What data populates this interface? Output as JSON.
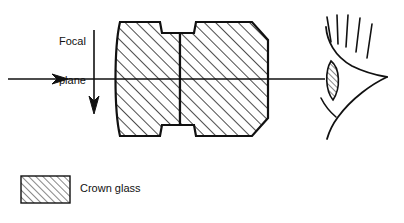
{
  "figure": {
    "type": "optical-ray-diagram",
    "background_color": "#ffffff",
    "ink_color": "#111111",
    "width": 404,
    "height": 223
  },
  "labels": {
    "focal_plane_line1": "Focal",
    "focal_plane_line2": "plane"
  },
  "legend": {
    "swatch_pattern": "diagonal-hatch",
    "items": [
      {
        "label": "Crown glass",
        "pattern": "diagonal-hatch",
        "fill": "#ffffff",
        "stroke": "#111111"
      }
    ]
  },
  "components": {
    "optical_axis": {
      "name": "optical-axis",
      "description": "horizontal ray line with rightward arrowhead",
      "y": 79,
      "x_start": 8,
      "x_end": 325,
      "arrow_x": 66
    },
    "focal_plane": {
      "name": "focal-plane-arrow",
      "description": "vertical line with downward arrowhead marking the focal plane",
      "x": 94,
      "y_start": 30,
      "y_end": 114
    },
    "lens_left": {
      "name": "crown-glass-element-left",
      "description": "hatched crown glass element with convex left face and notched right face",
      "material": "Crown glass"
    },
    "lens_right": {
      "name": "crown-glass-element-right",
      "description": "hatched crown glass element with notched left face and chamfered right face",
      "material": "Crown glass"
    },
    "eye": {
      "name": "eye-profile",
      "description": "stylized human eye in profile with eyelashes and hatched cornea",
      "eyelash_count": 5
    }
  }
}
